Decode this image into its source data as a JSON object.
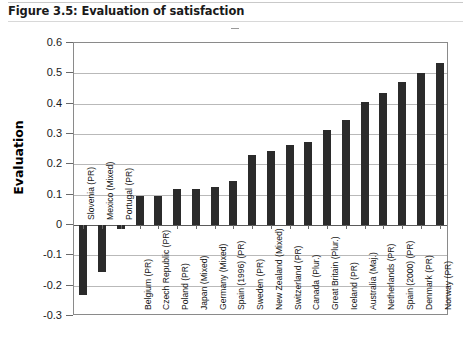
{
  "figure": {
    "title": "Figure 3.5: Evaluation of satisfaction"
  },
  "chart_data": {
    "type": "bar",
    "title": "Figure 3.5: Evaluation of satisfaction",
    "xlabel": "",
    "ylabel": "Evaluation",
    "ylim": [
      -0.3,
      0.6
    ],
    "ytick_labels": [
      "0.6",
      "0.5",
      "0.4",
      "0.3",
      "0.2",
      "0.1",
      "0",
      "-0.1",
      "-0.2",
      "-0.3"
    ],
    "ytick_values": [
      0.6,
      0.5,
      0.4,
      0.3,
      0.2,
      0.1,
      0,
      -0.1,
      -0.2,
      -0.3
    ],
    "grid": true,
    "legend": "none",
    "bar_color": "#2b2b2b",
    "categories": [
      "Slovenia (PR)",
      "Mexico (Mixed)",
      "Portugal (PR)",
      "Belgium (PR)",
      "Czech Republic (PR)",
      "Poland (PR)",
      "Japan (Mixed)",
      "Germany (Mixed)",
      "Spain (1996) (PR)",
      "Sweden (PR)",
      "New Zealand (Mixed)",
      "Switzerland (PR)",
      "Canada (Plur.)",
      "Great Britain (Plur.)",
      "Iceland (PR)",
      "Australia (Maj.)",
      "Netherlands (PR)",
      "Spain (2000) (PR)",
      "Denmark (PR)",
      "Norway (PR)"
    ],
    "values": [
      -0.23,
      -0.155,
      -0.012,
      0.095,
      0.095,
      0.12,
      0.12,
      0.125,
      0.145,
      0.23,
      0.245,
      0.265,
      0.272,
      0.312,
      0.345,
      0.405,
      0.435,
      0.47,
      0.5,
      0.535
    ]
  }
}
